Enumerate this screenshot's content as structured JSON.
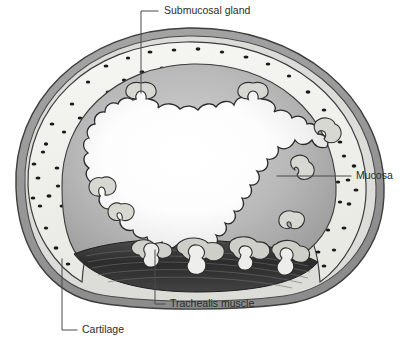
{
  "figure": {
    "background_color": "#ffffff",
    "width": 403,
    "height": 345
  },
  "labels": [
    {
      "id": "submucosal-gland",
      "text": "Submucosal gland",
      "text_x": 164,
      "text_y": 11,
      "anchor": "start",
      "leader_path": "M 158 11 L 141 11 L 141 93",
      "points_to": "gland protrusion at top of mucosa"
    },
    {
      "id": "mucosa",
      "text": "Mucosa",
      "text_x": 356,
      "text_y": 176,
      "anchor": "start",
      "leader_path": "M 351 176 L 277 176",
      "points_to": "inner wavy mucosal layer, right side"
    },
    {
      "id": "trachealis-muscle",
      "text": "Trachealis muscle",
      "text_x": 170,
      "text_y": 304,
      "anchor": "start",
      "leader_path": "M 165 304 L 155 304 L 155 250",
      "points_to": "dark muscle band at posterior wall"
    },
    {
      "id": "cartilage",
      "text": "Cartilage",
      "text_x": 82,
      "text_y": 330,
      "anchor": "start",
      "leader_path": "M 77 330 L 62 330 L 62 259",
      "points_to": "stippled C-shaped cartilage ring"
    }
  ],
  "structures": {
    "adventitia": {
      "name": "adventitia",
      "fill": "#9a9a9a",
      "stroke": "#4a4a4a",
      "description": "outermost dark gray ring"
    },
    "perichondrium": {
      "name": "perichondrium",
      "fill": "#d8d8d8",
      "stroke": "#4a4a4a",
      "description": "thin pale band inside adventitia"
    },
    "cartilage": {
      "name": "hyaline cartilage",
      "fill": "#f2f2ee",
      "stroke": "#4a4a4a",
      "description": "C-shaped stippled plate, open posteriorly",
      "chondrocyte_count": 96,
      "chondrocyte_fill": "#1c1c1c"
    },
    "submucosa": {
      "name": "submucosa",
      "fill": "#a9a9a9",
      "stroke": "#3c3c3c",
      "description": "mid gray zone between cartilage and mucosa"
    },
    "mucosa": {
      "name": "mucosa",
      "fill": "#b4b4b4",
      "stroke": "#2e2e2e",
      "description": "wavy scalloped inner lining"
    },
    "lumen": {
      "name": "lumen",
      "fill": "#ffffff",
      "description": "open airway, white with soft radial shading"
    },
    "trachealis": {
      "name": "trachealis muscle",
      "fill": "#3a3a3a",
      "stroke": "#202020",
      "description": "dark horizontal smooth-muscle bands across posterior wall"
    },
    "glands": {
      "name": "submucosal glands",
      "fill": "#d5d5d0",
      "stroke": "#3a3a3a",
      "description": "mushroom-shaped pale lobules"
    }
  }
}
